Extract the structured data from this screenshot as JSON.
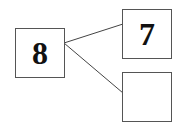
{
  "diagram": {
    "type": "number-bond",
    "whole": {
      "value": "8"
    },
    "parts": [
      {
        "value": "7"
      },
      {
        "value": ""
      }
    ],
    "colors": {
      "border": "#555555",
      "line": "#444444",
      "text": "#111111"
    }
  }
}
